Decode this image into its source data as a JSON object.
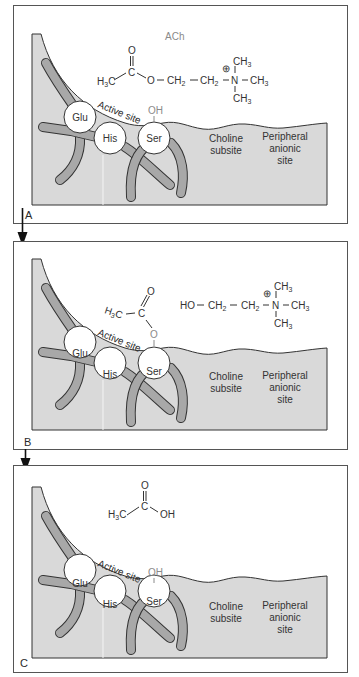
{
  "colors": {
    "enzyme_fill": "#d9d9d9",
    "tube_fill": "#a8a8a8",
    "outline": "#333333",
    "residue_fill": "#ffffff",
    "panel_border": "#555555",
    "faded_text": "#8a8a8a"
  },
  "panels": [
    {
      "label": "A",
      "molecule_name": "ACh",
      "molecule": {
        "carbonyl_O": "O",
        "carbonyl_C": "C",
        "methyl": "H",
        "methyl_sub": "3",
        "methyl_C": "C",
        "ester_O": "O",
        "ch2a": "CH",
        "ch2a_sub": "2",
        "ch2b": "CH",
        "ch2b_sub": "2",
        "N": "N",
        "charge": "⊕",
        "ch3_top": "CH",
        "ch3_top_sub": "3",
        "ch3_right": "CH",
        "ch3_right_sub": "3",
        "ch3_bottom": "CH",
        "ch3_bottom_sub": "3"
      },
      "ser_group": "OH"
    },
    {
      "label": "B",
      "acyl": {
        "methyl": "H",
        "methyl_sub": "3",
        "methyl_C": "C",
        "carbonyl_C": "C",
        "carbonyl_O": "O",
        "ser_O": "O"
      },
      "choline": {
        "HO": "HO",
        "ch2a": "CH",
        "ch2a_sub": "2",
        "ch2b": "CH",
        "ch2b_sub": "2",
        "N": "N",
        "charge": "⊕",
        "ch3_top": "CH",
        "ch3_top_sub": "3",
        "ch3_right": "CH",
        "ch3_right_sub": "3",
        "ch3_bottom": "CH",
        "ch3_bottom_sub": "3"
      }
    },
    {
      "label": "C",
      "acid": {
        "carbonyl_O": "O",
        "carbonyl_C": "C",
        "methyl": "H",
        "methyl_sub": "3",
        "methyl_C": "C",
        "OH": "OH"
      },
      "ser_group": "OH"
    }
  ],
  "enzyme": {
    "active_site_label": "Active site",
    "residues": [
      "Glu",
      "His",
      "Ser"
    ],
    "choline_subsite": [
      "Choline",
      "subsite"
    ],
    "peripheral_site": [
      "Peripheral",
      "anionic",
      "site"
    ]
  }
}
